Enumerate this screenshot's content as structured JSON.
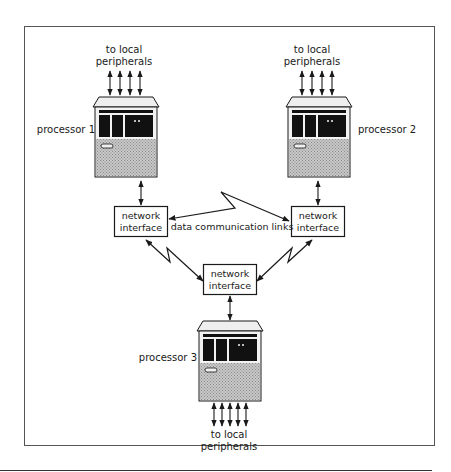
{
  "diagram": {
    "title": "",
    "processors": [
      {
        "label": "processor 1",
        "peripherals_label_line1": "to local",
        "peripherals_label_line2": "peripherals"
      },
      {
        "label": "processor 2",
        "peripherals_label_line1": "to local",
        "peripherals_label_line2": "peripherals"
      },
      {
        "label": "processor 3",
        "peripherals_label_line1": "to local",
        "peripherals_label_line2": "peripherals"
      }
    ],
    "network_interfaces": [
      {
        "line1": "network",
        "line2": "interface"
      },
      {
        "line1": "network",
        "line2": "interface"
      },
      {
        "line1": "network",
        "line2": "interface"
      }
    ],
    "links_label": "data communication links",
    "colors": {
      "stroke": "#1a1a1a",
      "frame": "#555555",
      "screen": "#111111",
      "base": "#bdbdbd",
      "cabinet": "#e8e8e8"
    }
  }
}
